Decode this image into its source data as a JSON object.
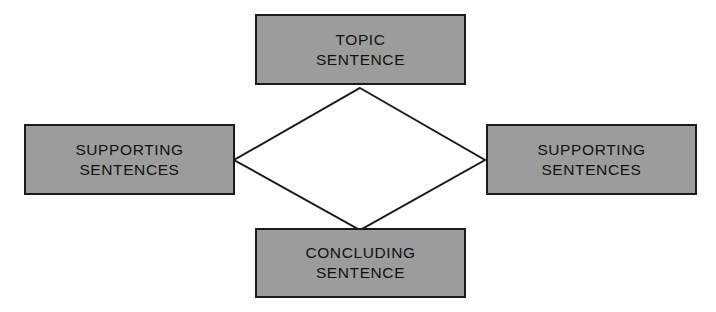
{
  "diagram": {
    "background_color": "#ffffff",
    "node_fill_color": "#9c9c9c",
    "node_border_color": "#1b1b1b",
    "connector_color": "#1b1b1b",
    "connector_fill_color": "#ffffff",
    "nodes": [
      {
        "id": "topic",
        "label": "TOPIC\nSENTENCE",
        "position": "top",
        "line1": "TOPIC",
        "line2": "SENTENCE"
      },
      {
        "id": "supporting-left",
        "label": "SUPPORTING\nSENTENCES",
        "position": "left",
        "line1": "SUPPORTING",
        "line2": "SENTENCES"
      },
      {
        "id": "supporting-right",
        "label": "SUPPORTING\nSENTENCES",
        "position": "right",
        "line1": "SUPPORTING",
        "line2": "SENTENCES"
      },
      {
        "id": "concluding",
        "label": "CONCLUDING\nSENTENCE",
        "position": "bottom",
        "line1": "CONCLUDING",
        "line2": "SENTENCE"
      }
    ],
    "connector": {
      "shape": "diamond",
      "vertices": {
        "top": [
          360,
          88
        ],
        "right": [
          485,
          160
        ],
        "bottom": [
          360,
          230
        ],
        "left": [
          234,
          160
        ]
      },
      "stroke_width": 2
    }
  }
}
